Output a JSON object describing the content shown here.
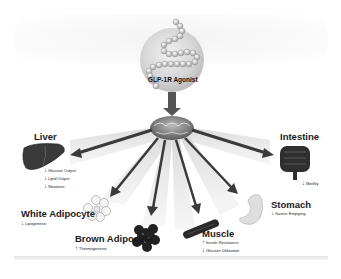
{
  "diagram": {
    "center": {
      "agonist_label": "GLP-1R Agonist",
      "hub": "brain"
    },
    "targets": [
      {
        "name": "Liver",
        "effects": [
          {
            "direction": "down",
            "text": "Glucose Output"
          },
          {
            "direction": "down",
            "text": "Lipid Output"
          },
          {
            "direction": "down",
            "text": "Steatosis"
          }
        ]
      },
      {
        "name": "Intestine",
        "effects": [
          {
            "direction": "down",
            "text": "Motility"
          }
        ]
      },
      {
        "name": "White Adipocyte",
        "effects": [
          {
            "direction": "down",
            "text": "Lipogenesis"
          }
        ]
      },
      {
        "name": "Brown Adipocyte",
        "effects": [
          {
            "direction": "up",
            "text": "Thermogenesis"
          }
        ]
      },
      {
        "name": "Muscle",
        "effects": [
          {
            "direction": "up",
            "text": "Insulin Resistance"
          },
          {
            "direction": "down",
            "text": "Glucose Utilization"
          }
        ]
      },
      {
        "name": "Stomach",
        "effects": [
          {
            "direction": "down",
            "text": "Gastric Emptying"
          }
        ]
      }
    ],
    "arrows": {
      "up": "↑",
      "down": "↓"
    },
    "colors": {
      "arrow_dark": "#3a3a3a",
      "ray_light": "#d9d9d9",
      "organ_dark": "#2e2e2e",
      "sphere": "#d8d8d8"
    }
  }
}
